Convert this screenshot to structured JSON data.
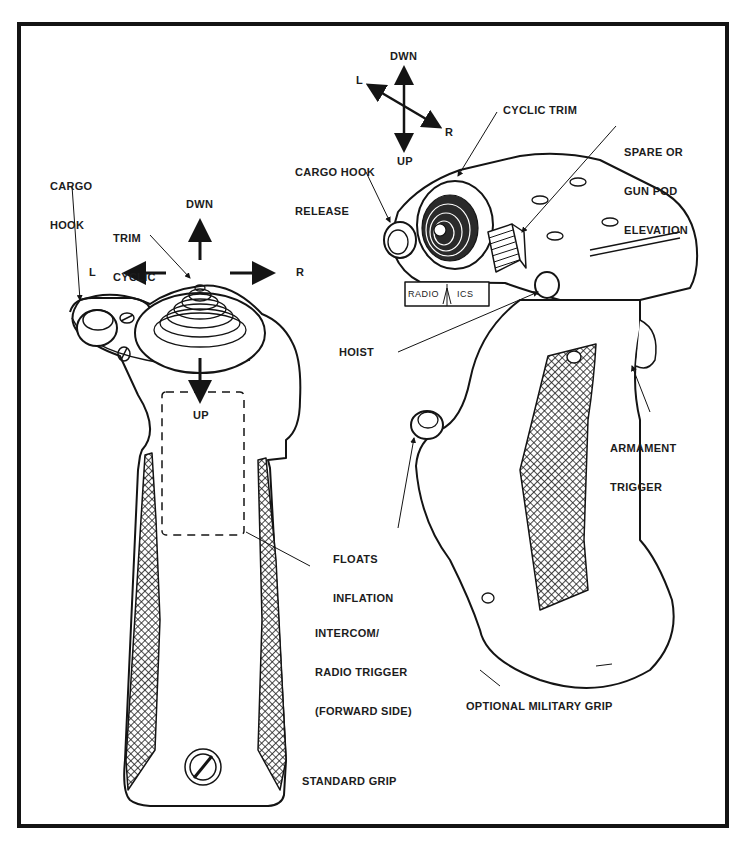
{
  "figure": {
    "standard_grip": {
      "caption": "STANDARD GRIP",
      "labels": {
        "cargo_hook": [
          "CARGO",
          "HOOK"
        ],
        "trim_cyclic": [
          "TRIM",
          "CYCLIC"
        ],
        "dir_dwn": "DWN",
        "dir_up": "UP",
        "dir_l": "L",
        "dir_r": "R",
        "intercom": [
          "INTERCOM/",
          "RADIO TRIGGER",
          "(FORWARD SIDE)"
        ]
      }
    },
    "military_grip": {
      "caption": "OPTIONAL MILITARY GRIP",
      "labels": {
        "dir_dwn": "DWN",
        "dir_up": "UP",
        "dir_l": "L",
        "dir_r": "R",
        "cyclic_trim": "CYCLIC TRIM",
        "cargo_hook_release": [
          "CARGO HOOK",
          "RELEASE"
        ],
        "spare_gun_pod": [
          "SPARE OR",
          "GUN POD",
          "ELEVATION"
        ],
        "hoist": "HOIST",
        "armament_trigger": [
          "ARMAMENT",
          "TRIGGER"
        ],
        "floats_inflation": [
          "FLOATS",
          "INFLATION"
        ],
        "switch_radio": "RADIO",
        "switch_ics": "ICS"
      }
    },
    "colors": {
      "ink": "#141414",
      "paper": "#ffffff"
    }
  }
}
